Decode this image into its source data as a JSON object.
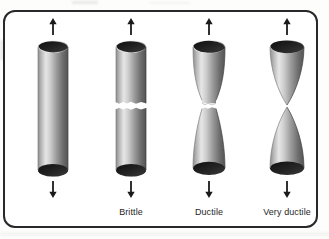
{
  "figure": {
    "type": "illustration",
    "frame": {
      "border_color": "#28282a",
      "background_color": "#ffffff",
      "corner_radius_px": 12
    },
    "page_background_color": "#fdfdfc",
    "specimens": [
      {
        "id": "specimen-unfractured",
        "caption": "",
        "shape": "straight-cylinder",
        "fracture": "none",
        "necking": "none",
        "arrow_up": "arrow-up-icon",
        "arrow_down": "arrow-down-icon"
      },
      {
        "id": "specimen-brittle",
        "caption": "Brittle",
        "shape": "straight-cylinder",
        "fracture": "flat-jagged-transverse",
        "necking": "none",
        "arrow_up": "arrow-up-icon",
        "arrow_down": "arrow-down-icon"
      },
      {
        "id": "specimen-ductile",
        "caption": "Ductile",
        "shape": "necked-cylinder",
        "fracture": "cup-and-cone-at-neck",
        "necking": "moderate",
        "arrow_up": "arrow-up-icon",
        "arrow_down": "arrow-down-icon"
      },
      {
        "id": "specimen-very-ductile",
        "caption": "Very ductile",
        "shape": "cone-to-point",
        "fracture": "drawn-to-a-point",
        "necking": "complete",
        "arrow_up": "arrow-up-icon",
        "arrow_down": "arrow-down-icon"
      }
    ],
    "colors": {
      "metal_light": "#e4e4e4",
      "metal_mid": "#a8a8a8",
      "metal_dark": "#5a5a5a",
      "end_cap_dark": "#1d1d1d",
      "arrow": "#1a1a1a",
      "caption_text": "#262626"
    }
  }
}
